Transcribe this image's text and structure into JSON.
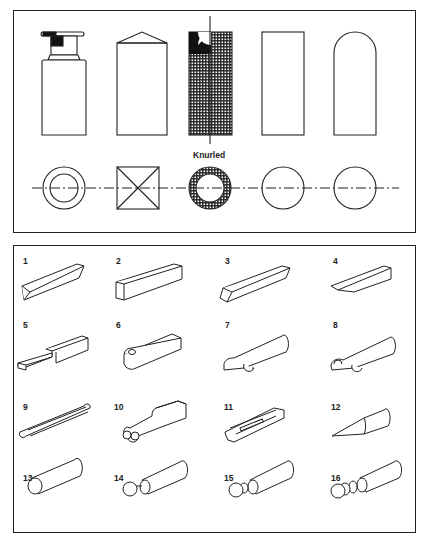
{
  "figure": {
    "top_panel": {
      "label": "Knurled",
      "shapes": [
        {
          "id": "stepped-collar",
          "elevation": "stepped shaft with collar",
          "plan": "concentric circles"
        },
        {
          "id": "square-pyramid",
          "elevation": "rectangle with pointed top",
          "plan": "square with diagonals"
        },
        {
          "id": "knurled",
          "elevation": "knurled cylinder",
          "plan": "knurled ring"
        },
        {
          "id": "flat-end",
          "elevation": "plain rectangle",
          "plan": "circle"
        },
        {
          "id": "round-end",
          "elevation": "round-ended rectangle",
          "plan": "circle"
        }
      ]
    },
    "bottom_panel": {
      "items": [
        {
          "number": "1"
        },
        {
          "number": "2"
        },
        {
          "number": "3"
        },
        {
          "number": "4"
        },
        {
          "number": "5"
        },
        {
          "number": "6"
        },
        {
          "number": "7"
        },
        {
          "number": "8"
        },
        {
          "number": "9"
        },
        {
          "number": "10"
        },
        {
          "number": "11"
        },
        {
          "number": "12"
        },
        {
          "number": "13"
        },
        {
          "number": "14"
        },
        {
          "number": "15"
        },
        {
          "number": "16"
        }
      ]
    },
    "colors": {
      "line": "#222222",
      "background": "#ffffff"
    }
  }
}
